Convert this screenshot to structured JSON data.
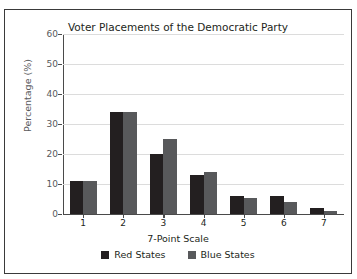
{
  "caption": {
    "text": "that the Parties Are Not Centrist"
  },
  "chart_data": {
    "type": "bar",
    "title": "Voter Placements of the Democratic Party",
    "xlabel": "7-Point Scale",
    "ylabel": "Percentage (%)",
    "categories": [
      "1",
      "2",
      "3",
      "4",
      "5",
      "6",
      "7"
    ],
    "series": [
      {
        "name": "Red States",
        "color": "#231f20",
        "values": [
          11,
          34,
          20,
          13,
          6,
          6,
          2
        ]
      },
      {
        "name": "Blue States",
        "color": "#58595b",
        "values": [
          11,
          34,
          25,
          14,
          5.5,
          4,
          1
        ]
      }
    ],
    "ylim": [
      0,
      60
    ],
    "yticks": [
      0,
      10,
      20,
      30,
      40,
      50,
      60
    ],
    "ytick_labels": [
      "0",
      "10",
      "20",
      "30",
      "40",
      "50",
      "60"
    ],
    "grid": true,
    "legend_position": "bottom"
  }
}
